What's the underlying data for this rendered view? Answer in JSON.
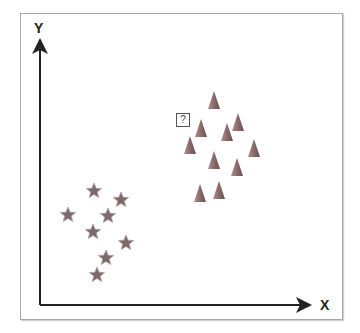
{
  "diagram": {
    "axes": {
      "x_label": "X",
      "y_label": "Y",
      "color": "#222222"
    },
    "query_point": {
      "label": "?",
      "x": 183,
      "y": 120
    },
    "class_triangle": {
      "shape": "triangle",
      "color": "#8a7070",
      "points": [
        [
          214,
          100
        ],
        [
          201,
          128
        ],
        [
          238,
          122
        ],
        [
          227,
          132
        ],
        [
          190,
          145
        ],
        [
          254,
          148
        ],
        [
          214,
          160
        ],
        [
          237,
          167
        ],
        [
          200,
          193
        ],
        [
          219,
          190
        ]
      ]
    },
    "class_star": {
      "shape": "star",
      "color": "#7a6a6a",
      "points": [
        [
          94,
          191
        ],
        [
          121,
          200
        ],
        [
          68,
          215
        ],
        [
          108,
          216
        ],
        [
          93,
          232
        ],
        [
          126,
          243
        ],
        [
          106,
          258
        ],
        [
          97,
          275
        ]
      ]
    }
  }
}
